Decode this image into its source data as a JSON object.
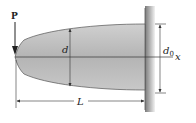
{
  "figure": {
    "labels": {
      "load": "P",
      "depth": "d",
      "depth_at_wall_main": "d",
      "depth_at_wall_sub": "0",
      "axis": "x",
      "length": "L"
    },
    "colors": {
      "beam_fill": "#b8b8b8",
      "beam_edge": "#555555",
      "wall": "#9a9a9a",
      "line": "#333333",
      "background": "#ffffff"
    }
  }
}
